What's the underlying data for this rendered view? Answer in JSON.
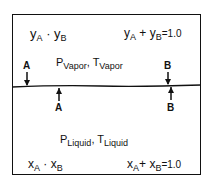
{
  "vapor": {
    "mole_fractions": {
      "a": "y",
      "a_sub": "A",
      "sep": "·",
      "b": "y",
      "b_sub": "B"
    },
    "sum": {
      "a": "y",
      "a_sub": "A",
      "plus": "+",
      "b": "y",
      "b_sub": "B",
      "eq": "=1.0"
    },
    "conditions": {
      "p": "P",
      "p_sub": "Vapor",
      "comma": ",",
      "t": "T",
      "t_sub": "Vapor"
    }
  },
  "liquid": {
    "mole_fractions": {
      "a": "x",
      "a_sub": "A",
      "sep": "·",
      "b": "x",
      "b_sub": "B"
    },
    "sum": {
      "a": "x",
      "a_sub": "A",
      "plus": "+",
      "b": "x",
      "b_sub": "B",
      "eq": "=1.0"
    },
    "conditions": {
      "p": "P",
      "p_sub": "Liquid",
      "comma": ",",
      "t": "T",
      "t_sub": "Liquid"
    }
  },
  "arrows": {
    "down_a": "A",
    "down_b": "B",
    "up_a": "A",
    "up_b": "B"
  }
}
